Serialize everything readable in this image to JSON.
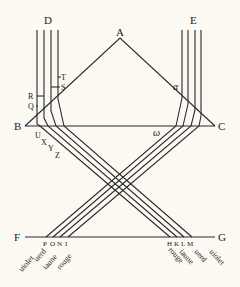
{
  "diagram": {
    "type": "optics-prism-ray-diagram",
    "line_color": "#2a2a2a",
    "background": "#fbf9f1",
    "points": {
      "A": "A",
      "B": "B",
      "C": "C",
      "D": "D",
      "E": "E",
      "F": "F",
      "G": "G"
    },
    "angle_labels": {
      "alpha": "α",
      "omega": "ω"
    },
    "left_ticks": {
      "T": "T",
      "S": "S",
      "R": "R",
      "Q": "Q"
    },
    "left_inner_ticks": {
      "U": "U",
      "X": "X",
      "Y": "Y",
      "Z": "Z"
    },
    "bottom_left_points": {
      "P": "P",
      "O": "O",
      "N": "N",
      "I": "I"
    },
    "bottom_right_points": {
      "H": "H",
      "K": "K",
      "L": "L",
      "M": "M"
    },
    "bottom_left_colors": [
      "uiolet",
      "uerd",
      "iaune",
      "rouge"
    ],
    "bottom_right_colors": [
      "rouge",
      "iaune",
      "uerd",
      "uiolet"
    ]
  }
}
